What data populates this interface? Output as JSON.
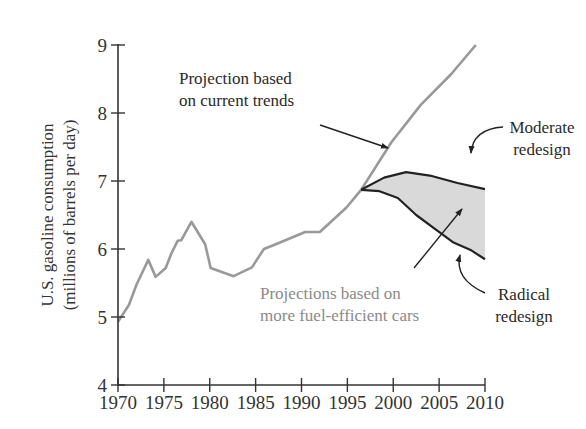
{
  "chart_data": {
    "type": "line",
    "title": "",
    "xlabel": "",
    "ylabel": "U.S. gasoline consumption",
    "ylabel_line2": "(millions of barrels per day)",
    "xlim": [
      1970,
      2010
    ],
    "ylim": [
      4,
      9
    ],
    "grid": false,
    "x_ticks": [
      "1970",
      "1975",
      "1980",
      "1985",
      "1990",
      "1995",
      "2000",
      "2005",
      "2010"
    ],
    "y_ticks": [
      "4",
      "5",
      "6",
      "7",
      "8",
      "9"
    ],
    "series": [
      {
        "name": "Historical consumption",
        "color": "#999999",
        "points": [
          [
            1970,
            4.93
          ],
          [
            1971.2,
            5.18
          ],
          [
            1972,
            5.47
          ],
          [
            1973.3,
            5.84
          ],
          [
            1974.1,
            5.59
          ],
          [
            1975.2,
            5.72
          ],
          [
            1975.8,
            5.93
          ],
          [
            1976.5,
            6.12
          ],
          [
            1976.9,
            6.13
          ],
          [
            1978,
            6.4
          ],
          [
            1979.5,
            6.07
          ],
          [
            1980.1,
            5.72
          ],
          [
            1982.6,
            5.6
          ],
          [
            1984.6,
            5.73
          ],
          [
            1985.9,
            6.0
          ],
          [
            1987,
            6.06
          ],
          [
            1990.4,
            6.25
          ],
          [
            1992,
            6.25
          ],
          [
            1994.9,
            6.61
          ],
          [
            1996.5,
            6.87
          ]
        ]
      },
      {
        "name": "Projection based on current trends",
        "color": "#999999",
        "points": [
          [
            1996.5,
            6.87
          ],
          [
            1999.8,
            7.57
          ],
          [
            2003,
            8.12
          ],
          [
            2006.3,
            8.57
          ],
          [
            2009,
            9.0
          ]
        ]
      },
      {
        "name": "Moderate redesign",
        "color": "#222222",
        "points": [
          [
            1996.5,
            6.87
          ],
          [
            1999,
            7.05
          ],
          [
            2001.4,
            7.13
          ],
          [
            2004,
            7.08
          ],
          [
            2007,
            6.97
          ],
          [
            2010,
            6.88
          ]
        ]
      },
      {
        "name": "Radical redesign",
        "color": "#222222",
        "points": [
          [
            1996.5,
            6.87
          ],
          [
            1998.5,
            6.85
          ],
          [
            2000.5,
            6.75
          ],
          [
            2002.5,
            6.5
          ],
          [
            2004.5,
            6.3
          ],
          [
            2006.5,
            6.1
          ],
          [
            2008.5,
            5.98
          ],
          [
            2010,
            5.85
          ]
        ]
      }
    ],
    "shaded_region": {
      "name": "Projections based on more fuel-efficient cars",
      "between": [
        "Moderate redesign",
        "Radical redesign"
      ],
      "color": "#d9d9d9"
    },
    "annotations": [
      {
        "lines": [
          "Projection based",
          "on current trends"
        ],
        "x": 179,
        "y": 84,
        "style": "dark",
        "arrow": [
          [
            320,
            125
          ],
          [
            388,
            148
          ]
        ]
      },
      {
        "lines": [
          "Moderate",
          "redesign"
        ],
        "x": 510,
        "y": 133,
        "style": "dark",
        "arrow": [
          [
            503,
            127
          ],
          [
            471,
            153
          ]
        ]
      },
      {
        "lines": [
          "Projections based on",
          "more fuel-efficient cars"
        ],
        "x": 260,
        "y": 299,
        "style": "gray",
        "arrow": [
          [
            414,
            268
          ],
          [
            462,
            209
          ]
        ]
      },
      {
        "lines": [
          "Radical",
          "redesign"
        ],
        "x": 492,
        "y": 300,
        "style": "dark",
        "arrow": [
          [
            485,
            293
          ],
          [
            460,
            255
          ]
        ]
      }
    ]
  }
}
